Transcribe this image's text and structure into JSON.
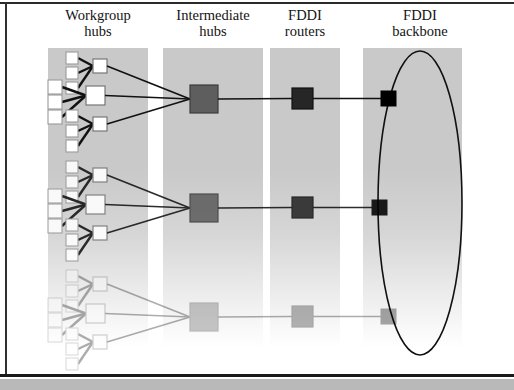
{
  "page": {
    "background": "#ffffff",
    "frame_color": "#2a2a2a"
  },
  "columns": [
    {
      "id": "workgroup-hubs",
      "line1": "Workgroup",
      "line2": "hubs",
      "band_x": 48,
      "band_w": 100,
      "label_cx": 98,
      "label_y": 8
    },
    {
      "id": "intermediate-hubs",
      "line1": "Intermediate",
      "line2": "hubs",
      "band_x": 163,
      "band_w": 100,
      "label_cx": 213,
      "label_y": 8
    },
    {
      "id": "fddi-routers",
      "line1": "FDDI",
      "line2": "routers",
      "band_x": 270,
      "band_w": 70,
      "label_cx": 305,
      "label_y": 8
    },
    {
      "id": "fddi-backbone",
      "line1": "FDDI",
      "line2": "backbone",
      "band_x": 363,
      "band_w": 99,
      "label_cx": 420,
      "label_y": 8
    }
  ],
  "style": {
    "band_top": 48,
    "band_height": 300,
    "band_color": "#c9c9c9",
    "workstation_fill": "#ffffff",
    "workstation_stroke": "#9a9a9a",
    "workgroup_hub_fill": "#ffffff",
    "workgroup_hub_stroke": "#777777",
    "intermediate_hub_fill": "#5e5e5e",
    "intermediate_hub_stroke": "#3d3d3d",
    "router_fill": "#262626",
    "router_stroke": "#111111",
    "backbone_node_fill": "#000000",
    "ring_stroke": "#111111",
    "link_color": "#111111"
  },
  "backbone": {
    "label": "FDDI ring",
    "ellipse_cx": 420,
    "ellipse_cy": 203,
    "ellipse_rx": 42,
    "ellipse_ry": 152,
    "node_x": 388
  },
  "groups": [
    {
      "id": "group-1",
      "opacity": 1,
      "intermediate_hub": {
        "x": 190,
        "y": 85,
        "size": 28
      },
      "router": {
        "x": 292,
        "y": 88,
        "size": 21
      },
      "backbone_node": {
        "x": 381,
        "y": 91,
        "size": 15
      },
      "clusters": [
        {
          "id": "cluster-1a",
          "hub": {
            "x": 93,
            "y": 59,
            "size": 14
          },
          "workstations_x": 66,
          "workstations_y": [
            52,
            67,
            82
          ],
          "ws_size": 12
        },
        {
          "id": "cluster-1b",
          "hub": {
            "x": 86,
            "y": 86,
            "size": 19
          },
          "workstations_x": 48,
          "workstations_y": [
            80,
            95,
            110
          ],
          "ws_size": 14
        },
        {
          "id": "cluster-1c",
          "hub": {
            "x": 93,
            "y": 117,
            "size": 14
          },
          "workstations_x": 66,
          "workstations_y": [
            110,
            125,
            140
          ],
          "ws_size": 12
        }
      ]
    },
    {
      "id": "group-2",
      "opacity": 0.88,
      "intermediate_hub": {
        "x": 190,
        "y": 194,
        "size": 28
      },
      "router": {
        "x": 292,
        "y": 197,
        "size": 21
      },
      "backbone_node": {
        "x": 372,
        "y": 200,
        "size": 15
      },
      "clusters": [
        {
          "id": "cluster-2a",
          "hub": {
            "x": 93,
            "y": 168,
            "size": 14
          },
          "workstations_x": 66,
          "workstations_y": [
            161,
            176,
            191
          ],
          "ws_size": 12
        },
        {
          "id": "cluster-2b",
          "hub": {
            "x": 86,
            "y": 195,
            "size": 19
          },
          "workstations_x": 48,
          "workstations_y": [
            189,
            204,
            219
          ],
          "ws_size": 14
        },
        {
          "id": "cluster-2c",
          "hub": {
            "x": 93,
            "y": 226,
            "size": 14
          },
          "workstations_x": 66,
          "workstations_y": [
            219,
            234,
            249
          ],
          "ws_size": 12
        }
      ]
    },
    {
      "id": "group-3",
      "opacity": 0.34,
      "intermediate_hub": {
        "x": 190,
        "y": 303,
        "size": 28
      },
      "router": {
        "x": 292,
        "y": 306,
        "size": 21
      },
      "backbone_node": {
        "x": 381,
        "y": 309,
        "size": 15
      },
      "clusters": [
        {
          "id": "cluster-3a",
          "hub": {
            "x": 93,
            "y": 277,
            "size": 14
          },
          "workstations_x": 66,
          "workstations_y": [
            270,
            285,
            300
          ],
          "ws_size": 12
        },
        {
          "id": "cluster-3b",
          "hub": {
            "x": 86,
            "y": 304,
            "size": 19
          },
          "workstations_x": 48,
          "workstations_y": [
            298,
            313,
            328
          ],
          "ws_size": 14
        },
        {
          "id": "cluster-3c",
          "hub": {
            "x": 93,
            "y": 335,
            "size": 14
          },
          "workstations_x": 66,
          "workstations_y": [
            328,
            343,
            358
          ],
          "ws_size": 12
        }
      ]
    }
  ]
}
